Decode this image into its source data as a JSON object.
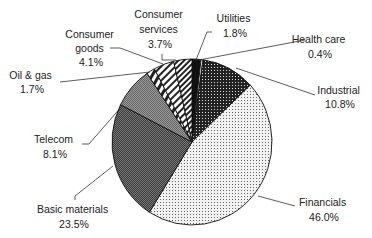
{
  "chart_data": {
    "type": "pie",
    "title": "",
    "start_angle_deg": 0,
    "direction": "clockwise",
    "legend": "none (direct labels with leader lines)",
    "slices": [
      {
        "label": "Utilities",
        "value": 1.8,
        "display": "1.8%",
        "pattern": "solid-black"
      },
      {
        "label": "Health care",
        "value": 0.4,
        "display": "0.4%",
        "pattern": "white"
      },
      {
        "label": "Industrial",
        "value": 10.8,
        "display": "10.8%",
        "pattern": "dense-dark-dots"
      },
      {
        "label": "Financials",
        "value": 46.0,
        "display": "46.0%",
        "pattern": "light-dots"
      },
      {
        "label": "Basic materials",
        "value": 23.5,
        "display": "23.5%",
        "pattern": "dark-checker"
      },
      {
        "label": "Telecom",
        "value": 8.1,
        "display": "8.1%",
        "pattern": "mid-gray-checker"
      },
      {
        "label": "Oil & gas",
        "value": 1.7,
        "display": "1.7%",
        "pattern": "bricks"
      },
      {
        "label": "Consumer goods",
        "value": 4.1,
        "display": "4.1%",
        "pattern": "wide-diagonal-stripes"
      },
      {
        "label": "Consumer services",
        "value": 3.7,
        "display": "3.7%",
        "pattern": "dense-diagonal-stripes"
      }
    ]
  },
  "labels": {
    "utilities": {
      "line1": "Utilities",
      "line2": "1.8%"
    },
    "health_care": {
      "line1": "Health care",
      "line2": "0.4%"
    },
    "industrial": {
      "line1": "Industrial",
      "line2": "10.8%"
    },
    "financials": {
      "line1": "Financials",
      "line2": "46.0%"
    },
    "basic_materials": {
      "line1": "Basic materials",
      "line2": "23.5%"
    },
    "telecom": {
      "line1": "Telecom",
      "line2": "8.1%"
    },
    "oil_gas": {
      "line1": "Oil & gas",
      "line2": "1.7%"
    },
    "consumer_goods": {
      "line1": "Consumer",
      "line2": "goods",
      "line3": "4.1%"
    },
    "consumer_services": {
      "line1": "Consumer",
      "line2": "services",
      "line3": "3.7%"
    }
  }
}
